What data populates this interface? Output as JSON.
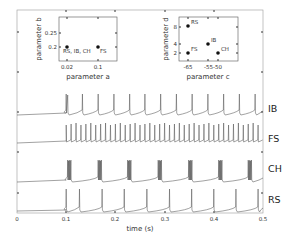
{
  "chart_data": [
    {
      "type": "line",
      "title": "",
      "xlabel": "time (s)",
      "ylabel": "",
      "xlim": [
        0,
        0.5
      ],
      "x_ticks": [
        "0",
        "0.1",
        "0.2",
        "0.3",
        "0.4",
        "0.5"
      ],
      "grid": false,
      "series": [
        {
          "name": "IB",
          "description": "intrinsically bursting: initial doublet at 0.1 s then regular single spikes",
          "spike_times": [
            0.1,
            0.104,
            0.133,
            0.165,
            0.197,
            0.229,
            0.26,
            0.292,
            0.324,
            0.356,
            0.388,
            0.42,
            0.452,
            0.484
          ]
        },
        {
          "name": "FS",
          "description": "fast spiking: high-frequency tonic spiking from 0.1 s",
          "onset": 0.1,
          "approx_rate_hz": 100
        },
        {
          "name": "CH",
          "description": "chattering: repetitive bursts",
          "burst_times": [
            0.103,
            0.165,
            0.225,
            0.287,
            0.349,
            0.41,
            0.47
          ]
        },
        {
          "name": "RS",
          "description": "regular spiking: single spikes with adaptation",
          "spike_times": [
            0.1,
            0.127,
            0.173,
            0.218,
            0.264,
            0.31,
            0.355,
            0.4,
            0.445,
            0.49
          ]
        }
      ],
      "stimulus_onset_s": 0.1,
      "traces_order_top_to_bottom": [
        "IB",
        "FS",
        "CH",
        "RS"
      ]
    },
    {
      "type": "scatter",
      "xlabel": "parameter a",
      "ylabel": "parameter b",
      "x_ticks": [
        "0.02",
        "0.1"
      ],
      "y_ticks": [
        "0.2",
        "0.25"
      ],
      "points": [
        {
          "x": 0.02,
          "y": 0.2,
          "label": "RS, IB, CH"
        },
        {
          "x": 0.1,
          "y": 0.2,
          "label": "FS"
        }
      ]
    },
    {
      "type": "scatter",
      "xlabel": "parameter c",
      "ylabel": "parameter d",
      "x_ticks": [
        "-65",
        "-55",
        "-50"
      ],
      "y_ticks": [
        "2",
        "4",
        "8"
      ],
      "points": [
        {
          "x": -65,
          "y": 8,
          "label": "RS"
        },
        {
          "x": -55,
          "y": 4,
          "label": "IB"
        },
        {
          "x": -65,
          "y": 2,
          "label": "FS"
        },
        {
          "x": -50,
          "y": 2,
          "label": "CH"
        }
      ]
    }
  ],
  "labels": {
    "time_axis": "time (s)",
    "x_ticks": [
      "0",
      "0.1",
      "0.2",
      "0.3",
      "0.4",
      "0.5"
    ],
    "traces": [
      "IB",
      "FS",
      "CH",
      "RS"
    ],
    "inset_ab": {
      "xlabel": "parameter a",
      "ylabel": "parameter b",
      "x_ticks": [
        "0.02",
        "0.1"
      ],
      "y_ticks": [
        "0.25",
        "0.2"
      ],
      "point_labels": [
        "RS, IB, CH",
        "FS"
      ]
    },
    "inset_cd": {
      "xlabel": "parameter c",
      "ylabel": "parameter d",
      "x_ticks": [
        "-65",
        "-55-50"
      ],
      "y_ticks": [
        "8",
        "4",
        "2"
      ],
      "point_labels": [
        "RS",
        "IB",
        "FS",
        "CH"
      ]
    }
  },
  "colors": {
    "trace": "#555555",
    "axes": "#888888",
    "points": "#111111"
  }
}
